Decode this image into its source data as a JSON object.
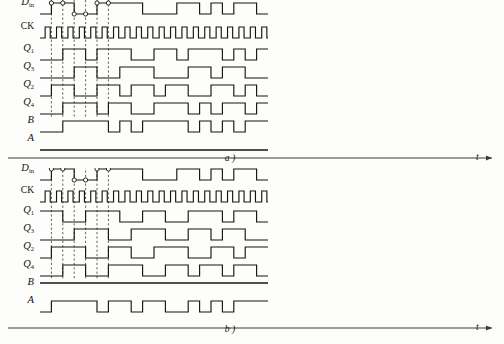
{
  "figure": {
    "type": "timing-diagram",
    "width": 504,
    "height": 344,
    "background_color": "#fdfdfb",
    "line_color": "#151515",
    "dashed_guide_color": "#3a3a3a"
  },
  "panels": [
    {
      "id": "a",
      "caption": "a )",
      "time_axis_label": "t",
      "origin_x": 40,
      "origin_y": 6,
      "unit": 11.4,
      "row_height": 18,
      "amplitude": 11,
      "rows": [
        {
          "name": "d-in",
          "label_html": "D<sub class=\"upr\">in</sub>",
          "label_main": "D",
          "label_sub": "in",
          "label_italic": true,
          "y": 14,
          "levels": [
            0,
            1,
            1,
            0,
            0,
            1,
            1,
            1,
            1,
            0,
            0,
            0,
            1,
            1,
            0,
            1,
            0,
            1,
            1,
            0
          ],
          "markers": [
            {
              "u": 1,
              "level": 1
            },
            {
              "u": 2,
              "level": 1
            },
            {
              "u": 3,
              "level": 0
            },
            {
              "u": 4,
              "level": 0
            },
            {
              "u": 5,
              "level": 1
            },
            {
              "u": 6,
              "level": 1
            }
          ]
        },
        {
          "name": "ck",
          "label_main": "CK",
          "label_sub": "",
          "label_italic": false,
          "y": 38,
          "clock": true,
          "periods": 20
        },
        {
          "name": "q1",
          "label_main": "Q",
          "label_sub": "1",
          "label_italic": true,
          "y": 60,
          "levels": [
            0,
            0,
            1,
            1,
            0,
            1,
            1,
            1,
            0,
            0,
            1,
            1,
            0,
            1,
            1,
            1,
            0,
            1,
            0,
            1
          ]
        },
        {
          "name": "q3",
          "label_main": "Q",
          "label_sub": "3",
          "label_italic": true,
          "y": 78,
          "levels": [
            0,
            0,
            0,
            1,
            1,
            0,
            0,
            1,
            1,
            1,
            0,
            0,
            0,
            1,
            1,
            0,
            1,
            1,
            0,
            0
          ]
        },
        {
          "name": "q2",
          "label_main": "Q",
          "label_sub": "2",
          "label_italic": true,
          "y": 96,
          "levels": [
            0,
            1,
            1,
            0,
            0,
            1,
            1,
            0,
            1,
            1,
            0,
            1,
            1,
            0,
            0,
            1,
            1,
            0,
            1,
            0
          ]
        },
        {
          "name": "q4",
          "label_main": "Q",
          "label_sub": "4",
          "label_italic": true,
          "y": 114,
          "levels": [
            0,
            0,
            1,
            1,
            1,
            0,
            1,
            1,
            0,
            0,
            1,
            1,
            1,
            0,
            1,
            0,
            1,
            1,
            0,
            1
          ]
        },
        {
          "name": "b",
          "label_main": "B",
          "label_sub": "",
          "label_italic": true,
          "y": 132,
          "levels": [
            0,
            0,
            1,
            1,
            1,
            1,
            0,
            1,
            0,
            1,
            1,
            1,
            1,
            0,
            1,
            0,
            1,
            0,
            1,
            1
          ]
        },
        {
          "name": "a",
          "label_main": "A",
          "label_sub": "",
          "label_italic": true,
          "y": 150,
          "levels": [
            0,
            0,
            0,
            0,
            0,
            0,
            0,
            0,
            0,
            0,
            0,
            0,
            0,
            0,
            0,
            0,
            0,
            0,
            0,
            0
          ]
        }
      ]
    },
    {
      "id": "b",
      "caption": "b )",
      "time_axis_label": "t",
      "origin_x": 40,
      "origin_y": 6,
      "unit": 11.4,
      "row_height": 18,
      "amplitude": 11,
      "rows": [
        {
          "name": "d-in",
          "label_main": "D",
          "label_sub": "in",
          "label_italic": true,
          "y": 12,
          "levels": [
            0,
            1,
            1,
            0,
            0,
            1,
            1,
            1,
            1,
            0,
            0,
            0,
            1,
            1,
            0,
            1,
            0,
            1,
            1,
            0
          ],
          "markers": [
            {
              "u": 1,
              "level": 1
            },
            {
              "u": 2,
              "level": 1
            },
            {
              "u": 3,
              "level": 0
            },
            {
              "u": 4,
              "level": 0
            },
            {
              "u": 5,
              "level": 1
            },
            {
              "u": 6,
              "level": 1
            }
          ]
        },
        {
          "name": "ck",
          "label_main": "CK",
          "label_sub": "",
          "label_italic": false,
          "y": 34,
          "clock": true,
          "periods": 20
        },
        {
          "name": "q1",
          "label_main": "Q",
          "label_sub": "1",
          "label_italic": true,
          "y": 54,
          "levels": [
            1,
            1,
            0,
            0,
            1,
            1,
            1,
            0,
            0,
            1,
            1,
            0,
            0,
            1,
            1,
            1,
            0,
            1,
            1,
            0
          ]
        },
        {
          "name": "q3",
          "label_main": "Q",
          "label_sub": "3",
          "label_italic": true,
          "y": 72,
          "levels": [
            0,
            0,
            0,
            1,
            1,
            1,
            0,
            0,
            1,
            1,
            1,
            0,
            0,
            1,
            1,
            0,
            1,
            1,
            0,
            0
          ]
        },
        {
          "name": "q2",
          "label_main": "Q",
          "label_sub": "2",
          "label_italic": true,
          "y": 90,
          "levels": [
            0,
            1,
            1,
            1,
            0,
            0,
            1,
            1,
            0,
            0,
            1,
            1,
            1,
            0,
            0,
            1,
            1,
            0,
            1,
            1
          ]
        },
        {
          "name": "q4",
          "label_main": "Q",
          "label_sub": "4",
          "label_italic": true,
          "y": 108,
          "levels": [
            0,
            0,
            1,
            1,
            0,
            0,
            1,
            1,
            1,
            0,
            0,
            1,
            1,
            0,
            1,
            1,
            0,
            1,
            1,
            0
          ]
        },
        {
          "name": "b",
          "label_main": "B",
          "label_sub": "",
          "label_italic": true,
          "y": 126,
          "levels": [
            1,
            1,
            1,
            1,
            1,
            1,
            1,
            1,
            1,
            1,
            1,
            1,
            1,
            1,
            1,
            1,
            1,
            1,
            1,
            1
          ]
        },
        {
          "name": "a",
          "label_main": "A",
          "label_sub": "",
          "label_italic": true,
          "y": 144,
          "levels": [
            0,
            1,
            1,
            1,
            1,
            0,
            1,
            1,
            0,
            1,
            1,
            0,
            0,
            1,
            0,
            1,
            0,
            1,
            1,
            1
          ]
        }
      ]
    }
  ],
  "guides": {
    "panel_a_dashed_x_units": [
      1,
      2,
      3,
      4,
      5,
      6
    ],
    "panel_b_dashed_x_units": [
      1,
      2,
      3,
      4,
      5,
      6
    ]
  }
}
